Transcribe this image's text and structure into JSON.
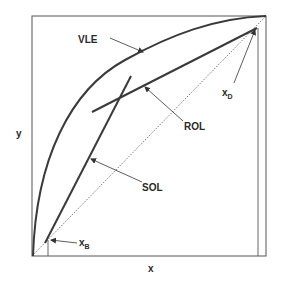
{
  "diagram": {
    "axes": {
      "x_label": "x",
      "y_label": "y"
    },
    "curves": {
      "vle": {
        "label": "VLE"
      },
      "rol": {
        "label": "ROL"
      },
      "sol": {
        "label": "SOL"
      },
      "diagonal": {
        "style": "dotted"
      }
    },
    "markers": {
      "x_b": {
        "main": "x",
        "sub": "B"
      },
      "x_d": {
        "main": "x",
        "sub": "D"
      }
    },
    "colors": {
      "line": "#3a3a3a",
      "frame": "#555555",
      "text": "#2a2a2a"
    }
  }
}
